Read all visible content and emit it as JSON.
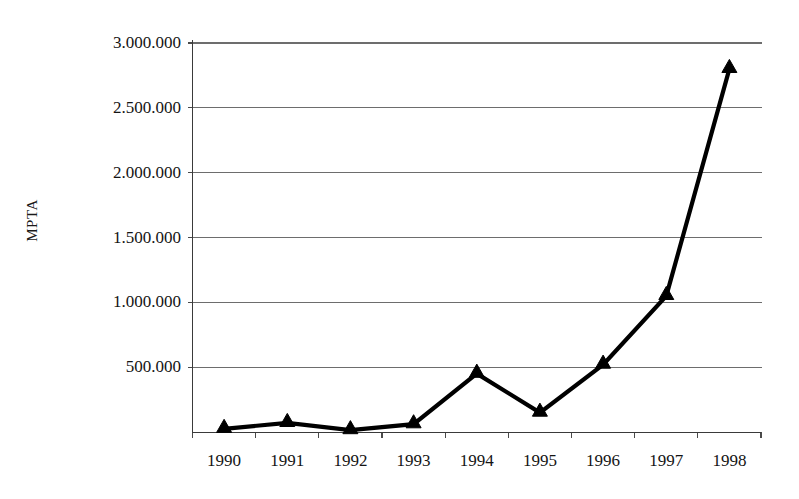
{
  "chart_data": {
    "type": "line",
    "title": "",
    "xlabel": "",
    "ylabel": "MPTA",
    "categories": [
      "1990",
      "1991",
      "1992",
      "1993",
      "1994",
      "1995",
      "1996",
      "1997",
      "1998"
    ],
    "values": [
      25000,
      70000,
      15000,
      60000,
      450000,
      150000,
      520000,
      1050000,
      2800000
    ],
    "series": [
      {
        "name": "MPTA",
        "values": [
          25000,
          70000,
          15000,
          60000,
          450000,
          150000,
          520000,
          1050000,
          2800000
        ]
      }
    ],
    "ylim": [
      0,
      3000000
    ],
    "y_ticks": [
      0,
      500000,
      1000000,
      1500000,
      2000000,
      2500000,
      3000000
    ],
    "y_tick_labels": [
      "",
      "500.000",
      "1.000.000",
      "1.500.000",
      "2.000.000",
      "2.500.000",
      "3.000.000"
    ],
    "grid": true,
    "legend": false,
    "marker": "triangle",
    "line_color": "#000000",
    "grid_color": "#6d6d6d",
    "background": "#ffffff",
    "decimal_separator": "."
  },
  "axes": {
    "y_title": "MPTA",
    "y_labels": [
      {
        "text": "3.000.000",
        "value": 3000000
      },
      {
        "text": "2.500.000",
        "value": 2500000
      },
      {
        "text": "2.000.000",
        "value": 2000000
      },
      {
        "text": "1.500.000",
        "value": 1500000
      },
      {
        "text": "1.000.000",
        "value": 1000000
      },
      {
        "text": "500.000",
        "value": 500000
      }
    ],
    "x_labels": [
      {
        "text": "1990"
      },
      {
        "text": "1991"
      },
      {
        "text": "1992"
      },
      {
        "text": "1993"
      },
      {
        "text": "1994"
      },
      {
        "text": "1995"
      },
      {
        "text": "1996"
      },
      {
        "text": "1997"
      },
      {
        "text": "1998"
      }
    ]
  }
}
